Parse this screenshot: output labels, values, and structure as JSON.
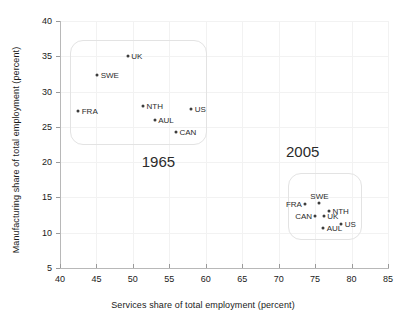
{
  "chart_data": {
    "type": "scatter",
    "title": "",
    "xlabel": "Services share of total employment (percent)",
    "ylabel": "Manufacturing share of total employment (percent)",
    "xlim": [
      40,
      85
    ],
    "ylim": [
      5,
      40
    ],
    "xticks": [
      40,
      45,
      50,
      55,
      60,
      65,
      70,
      75,
      80,
      85
    ],
    "yticks": [
      5,
      10,
      15,
      20,
      25,
      30,
      35,
      40
    ],
    "grid": true,
    "legend": "none",
    "annotations": [
      {
        "text": "1965",
        "x": 53.5,
        "y": 20.0
      },
      {
        "text": "2005",
        "x": 73.3,
        "y": 21.5
      }
    ],
    "groups": [
      {
        "name": "1965",
        "label": "1965",
        "box": {
          "x0": 41.4,
          "x1": 59.9,
          "y0": 22.7,
          "y1": 37.3
        },
        "points": [
          {
            "label": "UK",
            "x": 49.3,
            "y": 35.0,
            "label_side": "right"
          },
          {
            "label": "SWE",
            "x": 45.1,
            "y": 32.3,
            "label_side": "right"
          },
          {
            "label": "FRA",
            "x": 42.5,
            "y": 27.3,
            "label_side": "right"
          },
          {
            "label": "NTH",
            "x": 51.4,
            "y": 28.0,
            "label_side": "right"
          },
          {
            "label": "AUL",
            "x": 53.0,
            "y": 26.0,
            "label_side": "right"
          },
          {
            "label": "US",
            "x": 58.0,
            "y": 27.5,
            "label_side": "right"
          },
          {
            "label": "CAN",
            "x": 55.9,
            "y": 24.3,
            "label_side": "right"
          }
        ]
      },
      {
        "name": "2005",
        "label": "2005",
        "box": {
          "x0": 71.3,
          "x1": 81.2,
          "y0": 9.3,
          "y1": 18.5
        },
        "points": [
          {
            "label": "FRA",
            "x": 73.6,
            "y": 14.0,
            "label_side": "left"
          },
          {
            "label": "SWE",
            "x": 75.6,
            "y": 14.2,
            "label_side": "above"
          },
          {
            "label": "NTH",
            "x": 76.9,
            "y": 13.1,
            "label_side": "right"
          },
          {
            "label": "CAN",
            "x": 75.0,
            "y": 12.4,
            "label_side": "left"
          },
          {
            "label": "UK",
            "x": 76.2,
            "y": 12.3,
            "label_side": "right"
          },
          {
            "label": "AUL",
            "x": 76.1,
            "y": 10.6,
            "label_side": "right"
          },
          {
            "label": "US",
            "x": 78.6,
            "y": 11.2,
            "label_side": "right"
          }
        ]
      }
    ]
  }
}
